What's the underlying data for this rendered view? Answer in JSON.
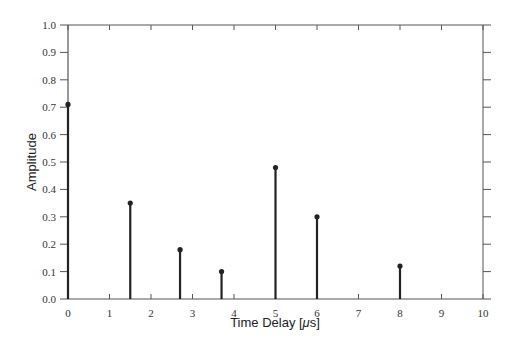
{
  "chart_data": {
    "type": "stem",
    "title": "",
    "xlabel": "Time Delay [μs]",
    "xlabel_prefix": "Time Delay [",
    "xlabel_mu": "μ",
    "xlabel_suffix": "s]",
    "ylabel": "Amplitude",
    "xlim": [
      0,
      10
    ],
    "ylim": [
      0.0,
      1.0
    ],
    "x_ticks": [
      "0",
      "1",
      "2",
      "3",
      "4",
      "5",
      "6",
      "7",
      "8",
      "9",
      "10"
    ],
    "y_ticks": [
      "0.0",
      "0.1",
      "0.2",
      "0.3",
      "0.4",
      "0.5",
      "0.6",
      "0.7",
      "0.8",
      "0.9",
      "1.0"
    ],
    "grid": false,
    "legend": null,
    "x": [
      0,
      1.5,
      2.7,
      3.7,
      5,
      6,
      8
    ],
    "values": [
      0.71,
      0.35,
      0.18,
      0.1,
      0.48,
      0.3,
      0.12
    ]
  }
}
